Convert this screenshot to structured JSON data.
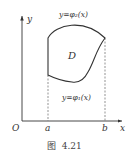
{
  "figure": {
    "caption": "图  4.21",
    "axes": {
      "x_label": "x",
      "y_label": "y",
      "origin_label": "O",
      "x_ticks": [
        "a",
        "b"
      ]
    },
    "region_label": "D",
    "upper_curve_label": "y=φ₂(x)",
    "lower_curve_label": "y=φ₁(x)",
    "colors": {
      "line": "#333333",
      "dashed": "#666666",
      "background": "#ffffff"
    }
  }
}
